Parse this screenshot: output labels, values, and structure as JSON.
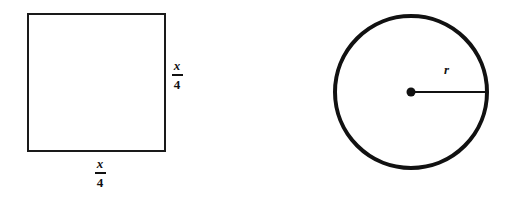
{
  "figure": {
    "background_color": "#ffffff",
    "ink_color": "#111111",
    "width": 511,
    "height": 204,
    "shapes": [
      {
        "name": "square",
        "type": "square",
        "stroke_color": "#1a1a1a",
        "stroke_width": 2,
        "fill": "none",
        "x": 27,
        "y": 13,
        "side": 138
      },
      {
        "name": "circle",
        "type": "circle",
        "stroke_color": "#111111",
        "stroke_width": 4,
        "fill": "none",
        "center_x": 411,
        "center_y": 92,
        "radius": 77
      }
    ],
    "center_dot": {
      "name": "circle-center-point",
      "center_x": 411,
      "center_y": 92,
      "radius": 4.5,
      "color": "#111111"
    },
    "radius_line": {
      "name": "radius-segment",
      "x1": 411,
      "y1": 92,
      "x2": 487,
      "y2": 92,
      "stroke_width": 2,
      "color": "#111111"
    }
  },
  "labels": {
    "square_height": {
      "numerator": "x",
      "denominator": "4",
      "text": "x/4"
    },
    "square_width": {
      "numerator": "x",
      "denominator": "4",
      "text": "x/4"
    },
    "radius": {
      "text": "r"
    }
  }
}
